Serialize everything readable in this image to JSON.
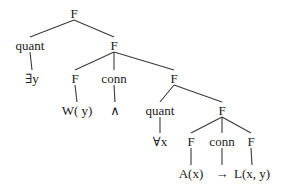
{
  "diagram": {
    "type": "syntax-tree",
    "background": "#ffffff",
    "line_color": "#3a3a3a",
    "nodes": [
      {
        "id": "n0",
        "label": "F",
        "x": 74,
        "y": 13,
        "kind": "category"
      },
      {
        "id": "n1",
        "label": "quant",
        "x": 30,
        "y": 45,
        "kind": "category"
      },
      {
        "id": "n2",
        "label": "F",
        "x": 114,
        "y": 45,
        "kind": "category"
      },
      {
        "id": "n3",
        "label": "∃y",
        "x": 32,
        "y": 78,
        "kind": "terminal"
      },
      {
        "id": "n4",
        "label": "F",
        "x": 75,
        "y": 78,
        "kind": "category"
      },
      {
        "id": "n5",
        "label": "conn",
        "x": 114,
        "y": 78,
        "kind": "category"
      },
      {
        "id": "n6",
        "label": "F",
        "x": 174,
        "y": 78,
        "kind": "category"
      },
      {
        "id": "n7",
        "label": "W( y)",
        "x": 77,
        "y": 110,
        "kind": "terminal"
      },
      {
        "id": "n8",
        "label": "∧",
        "x": 115,
        "y": 110,
        "kind": "terminal"
      },
      {
        "id": "n9",
        "label": "quant",
        "x": 160,
        "y": 110,
        "kind": "category"
      },
      {
        "id": "n10",
        "label": "F",
        "x": 222,
        "y": 110,
        "kind": "category"
      },
      {
        "id": "n11",
        "label": "∀x",
        "x": 160,
        "y": 141,
        "kind": "terminal"
      },
      {
        "id": "n12",
        "label": "F",
        "x": 191,
        "y": 141,
        "kind": "category"
      },
      {
        "id": "n13",
        "label": "conn",
        "x": 222,
        "y": 141,
        "kind": "category"
      },
      {
        "id": "n14",
        "label": "F",
        "x": 251,
        "y": 141,
        "kind": "category"
      },
      {
        "id": "n15",
        "label": "A(x)",
        "x": 191,
        "y": 173,
        "kind": "terminal"
      },
      {
        "id": "n16",
        "label": "→",
        "x": 222,
        "y": 173,
        "kind": "terminal"
      },
      {
        "id": "n17",
        "label": "L(x, y)",
        "x": 252,
        "y": 173,
        "kind": "terminal"
      }
    ],
    "edges": [
      {
        "from": "n0",
        "to": "n1"
      },
      {
        "from": "n0",
        "to": "n2"
      },
      {
        "from": "n1",
        "to": "n3"
      },
      {
        "from": "n2",
        "to": "n4"
      },
      {
        "from": "n2",
        "to": "n5"
      },
      {
        "from": "n2",
        "to": "n6"
      },
      {
        "from": "n4",
        "to": "n7"
      },
      {
        "from": "n5",
        "to": "n8"
      },
      {
        "from": "n6",
        "to": "n9"
      },
      {
        "from": "n6",
        "to": "n10"
      },
      {
        "from": "n9",
        "to": "n11"
      },
      {
        "from": "n10",
        "to": "n12"
      },
      {
        "from": "n10",
        "to": "n13"
      },
      {
        "from": "n10",
        "to": "n14"
      },
      {
        "from": "n12",
        "to": "n15"
      },
      {
        "from": "n13",
        "to": "n16"
      },
      {
        "from": "n14",
        "to": "n17"
      }
    ]
  }
}
